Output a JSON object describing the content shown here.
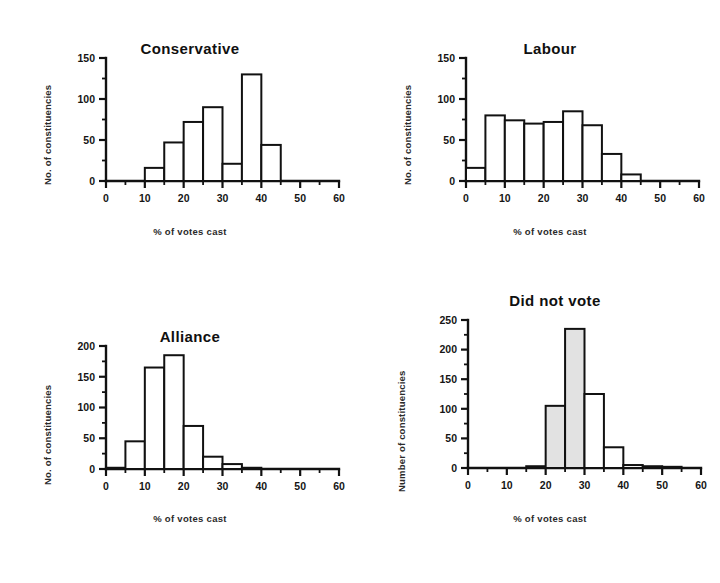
{
  "figure": {
    "caption_present": false,
    "background": "#ffffff",
    "ink_color": "#111111",
    "shade_color": "#e2e2e2"
  },
  "panels": [
    {
      "id": "conservative",
      "title": "Conservative",
      "xlabel": "% of votes cast",
      "ylabel": "No. of constituencies",
      "y_ticks": [
        "0",
        "50",
        "100",
        "150"
      ],
      "x_ticks": [
        "0",
        "10",
        "20",
        "30",
        "40",
        "50",
        "60"
      ]
    },
    {
      "id": "labour",
      "title": "Labour",
      "xlabel": "% of votes cast",
      "ylabel": "No. of constituencies",
      "y_ticks": [
        "0",
        "50",
        "100",
        "150"
      ],
      "x_ticks": [
        "0",
        "10",
        "20",
        "30",
        "40",
        "50",
        "60"
      ]
    },
    {
      "id": "alliance",
      "title": "Alliance",
      "xlabel": "% of votes cast",
      "ylabel": "No. of constituencies",
      "y_ticks": [
        "0",
        "50",
        "100",
        "150",
        "200"
      ],
      "x_ticks": [
        "0",
        "10",
        "20",
        "30",
        "40",
        "50",
        "60"
      ]
    },
    {
      "id": "didnotvote",
      "title": "Did not vote",
      "xlabel": "% of votes cast",
      "ylabel": "Number of constituencies",
      "y_ticks": [
        "0",
        "50",
        "100",
        "150",
        "200",
        "250"
      ],
      "x_ticks": [
        "0",
        "10",
        "20",
        "30",
        "40",
        "50",
        "60"
      ]
    }
  ],
  "chart_data": [
    {
      "type": "bar",
      "id": "conservative",
      "title": "Conservative",
      "xlabel": "% of votes cast",
      "ylabel": "No. of constituencies",
      "bin_width": 5,
      "xlim": [
        0,
        60
      ],
      "ylim": [
        0,
        150
      ],
      "y_ticks": [
        0,
        50,
        100,
        150
      ],
      "x_ticks": [
        0,
        10,
        20,
        30,
        40,
        50,
        60
      ],
      "x_minor_ticks": [
        5,
        15,
        25,
        35,
        45,
        55
      ],
      "grid": false,
      "legend": null,
      "bin_starts": [
        0,
        5,
        10,
        15,
        20,
        25,
        30,
        35,
        40,
        45,
        50,
        55
      ],
      "values": [
        0,
        0,
        16,
        47,
        72,
        90,
        21,
        130,
        44,
        0,
        0,
        0
      ],
      "bars": [
        {
          "bin": "10-15",
          "value": 16
        },
        {
          "bin": "15-20",
          "value": 47
        },
        {
          "bin": "20-25",
          "value": 72
        },
        {
          "bin": "25-30",
          "value": 90
        },
        {
          "bin": "30-35",
          "value": 21
        },
        {
          "bin": "35-40",
          "value": 130
        },
        {
          "bin": "40-45",
          "value": 44
        }
      ],
      "shaded_bins": []
    },
    {
      "type": "bar",
      "id": "labour",
      "title": "Labour",
      "xlabel": "% of votes cast",
      "ylabel": "No. of constituencies",
      "bin_width": 5,
      "xlim": [
        0,
        60
      ],
      "ylim": [
        0,
        150
      ],
      "y_ticks": [
        0,
        50,
        100,
        150
      ],
      "x_ticks": [
        0,
        10,
        20,
        30,
        40,
        50,
        60
      ],
      "x_minor_ticks": [
        5,
        15,
        25,
        35,
        45,
        55
      ],
      "grid": false,
      "legend": null,
      "bin_starts": [
        0,
        5,
        10,
        15,
        20,
        25,
        30,
        35,
        40,
        45,
        50,
        55
      ],
      "values": [
        16,
        80,
        74,
        70,
        72,
        85,
        68,
        33,
        8,
        0,
        0,
        0
      ],
      "bars": [
        {
          "bin": "0-5",
          "value": 16
        },
        {
          "bin": "5-10",
          "value": 80
        },
        {
          "bin": "10-15",
          "value": 74
        },
        {
          "bin": "15-20",
          "value": 70
        },
        {
          "bin": "20-25",
          "value": 72
        },
        {
          "bin": "25-30",
          "value": 85
        },
        {
          "bin": "30-35",
          "value": 68
        },
        {
          "bin": "35-40",
          "value": 33
        },
        {
          "bin": "40-45",
          "value": 8
        }
      ],
      "shaded_bins": []
    },
    {
      "type": "bar",
      "id": "alliance",
      "title": "Alliance",
      "xlabel": "% of votes cast",
      "ylabel": "No. of constituencies",
      "bin_width": 5,
      "xlim": [
        0,
        60
      ],
      "ylim": [
        0,
        200
      ],
      "y_ticks": [
        0,
        50,
        100,
        150,
        200
      ],
      "x_ticks": [
        0,
        10,
        20,
        30,
        40,
        50,
        60
      ],
      "x_minor_ticks": [
        5,
        15,
        25,
        35,
        45,
        55
      ],
      "grid": false,
      "legend": null,
      "bin_starts": [
        0,
        5,
        10,
        15,
        20,
        25,
        30,
        35,
        40,
        45,
        50,
        55
      ],
      "values": [
        2,
        45,
        165,
        185,
        70,
        20,
        8,
        2,
        0,
        0,
        0,
        0
      ],
      "bars": [
        {
          "bin": "0-5",
          "value": 2
        },
        {
          "bin": "5-10",
          "value": 45
        },
        {
          "bin": "10-15",
          "value": 165
        },
        {
          "bin": "15-20",
          "value": 185
        },
        {
          "bin": "20-25",
          "value": 70
        },
        {
          "bin": "25-30",
          "value": 20
        },
        {
          "bin": "30-35",
          "value": 8
        },
        {
          "bin": "35-40",
          "value": 2
        }
      ],
      "shaded_bins": []
    },
    {
      "type": "bar",
      "id": "didnotvote",
      "title": "Did not vote",
      "xlabel": "% of votes cast",
      "ylabel": "Number of constituencies",
      "bin_width": 5,
      "xlim": [
        0,
        60
      ],
      "ylim": [
        0,
        250
      ],
      "y_ticks": [
        0,
        50,
        100,
        150,
        200,
        250
      ],
      "x_ticks": [
        0,
        10,
        20,
        30,
        40,
        50,
        60
      ],
      "x_minor_ticks": [
        5,
        15,
        25,
        35,
        45,
        55
      ],
      "grid": false,
      "legend": null,
      "bin_starts": [
        0,
        5,
        10,
        15,
        20,
        25,
        30,
        35,
        40,
        45,
        50,
        55
      ],
      "values": [
        0,
        0,
        0,
        3,
        105,
        235,
        125,
        35,
        5,
        3,
        2,
        0
      ],
      "bars": [
        {
          "bin": "15-20",
          "value": 3
        },
        {
          "bin": "20-25",
          "value": 105
        },
        {
          "bin": "25-30",
          "value": 235
        },
        {
          "bin": "30-35",
          "value": 125
        },
        {
          "bin": "35-40",
          "value": 35
        },
        {
          "bin": "40-45",
          "value": 5
        },
        {
          "bin": "45-50",
          "value": 3
        },
        {
          "bin": "50-55",
          "value": 2
        }
      ],
      "shaded_bins": [
        "20-25",
        "25-30"
      ]
    }
  ]
}
